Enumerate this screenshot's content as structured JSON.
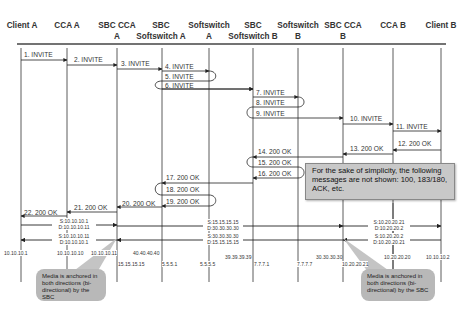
{
  "headers": [
    {
      "label": "Client A",
      "x": 22
    },
    {
      "label": "CCA A",
      "x": 67
    },
    {
      "label": "SBC CCA\nA",
      "x": 117
    },
    {
      "label": "SBC\nSoftswitch A",
      "x": 161
    },
    {
      "label": "Softswitch\nA",
      "x": 209
    },
    {
      "label": "SBC\nSoftswitch B",
      "x": 253
    },
    {
      "label": "Softswitch\nB",
      "x": 298
    },
    {
      "label": "SBC CCA\nB",
      "x": 343
    },
    {
      "label": "CCA B",
      "x": 393
    },
    {
      "label": "Client B",
      "x": 441
    }
  ],
  "messages": [
    {
      "label": "1. INVITE"
    },
    {
      "label": "2. INVITE"
    },
    {
      "label": "3. INVITE"
    },
    {
      "label": "4. INVITE"
    },
    {
      "label": "5. INVITE"
    },
    {
      "label": "6. INVITE"
    },
    {
      "label": "7. INVITE"
    },
    {
      "label": "8. INVITE"
    },
    {
      "label": "9. INVITE"
    },
    {
      "label": "10. INVITE"
    },
    {
      "label": "11. INVITE"
    },
    {
      "label": "12. 200 OK"
    },
    {
      "label": "13. 200 OK"
    },
    {
      "label": "14. 200 OK"
    },
    {
      "label": "15. 200 OK"
    },
    {
      "label": "16. 200 OK"
    },
    {
      "label": "17. 200 OK"
    },
    {
      "label": "18. 200 OK"
    },
    {
      "label": "19. 200 OK"
    },
    {
      "label": "20. 200 OK"
    },
    {
      "label": "21. 200 OK"
    },
    {
      "label": "22. 200 OK"
    }
  ],
  "callout": {
    "text": "For the sake of simplicity, the following messages are not shown: 100, 183/180, ACK, etc."
  },
  "media": {
    "seg1_fwd": [
      "S:10.10.10.1",
      "D:10.10.10.11"
    ],
    "seg1_rev": [
      "S:10.10.10.11",
      "D:10.10.10.1"
    ],
    "seg2_fwd": [
      "S:15.15.15.15",
      "D:30.30.30.30"
    ],
    "seg2_rev": [
      "S:30.30.30.30",
      "D:15.15.15.15"
    ],
    "seg3_fwd": [
      "S:10.20.20.21",
      "D:10.20.20.2"
    ],
    "seg3_rev": [
      "S:10.20.20.2",
      "D:10.20.20.21"
    ]
  },
  "ips": [
    {
      "text": "10.10.10.1",
      "x": 4,
      "y": 253
    },
    {
      "text": "10.10.10.10",
      "x": 57,
      "y": 253
    },
    {
      "text": "10.10.10.11",
      "x": 91,
      "y": 253
    },
    {
      "text": "40.40.40.40",
      "x": 133,
      "y": 253
    },
    {
      "text": "15.15.15.15",
      "x": 118,
      "y": 263
    },
    {
      "text": "5.5.5.1",
      "x": 162,
      "y": 263
    },
    {
      "text": "5.5.5.5",
      "x": 200,
      "y": 263
    },
    {
      "text": "39.39.39.39",
      "x": 225,
      "y": 256
    },
    {
      "text": "7.7.7.1",
      "x": 254,
      "y": 263
    },
    {
      "text": "7.7.7.7",
      "x": 297,
      "y": 263
    },
    {
      "text": "30.30.30.30",
      "x": 316,
      "y": 256
    },
    {
      "text": "10.20.20.21",
      "x": 342,
      "y": 263
    },
    {
      "text": "10.20.20.20",
      "x": 384,
      "y": 256
    },
    {
      "text": "10.10.10.2",
      "x": 426,
      "y": 256
    }
  ],
  "media_notes": [
    {
      "text": "Media is anchored in both directions (bi-directional) by the SBC"
    },
    {
      "text": "Media is anchored in both directions (bi-directional) by the SBC"
    }
  ]
}
